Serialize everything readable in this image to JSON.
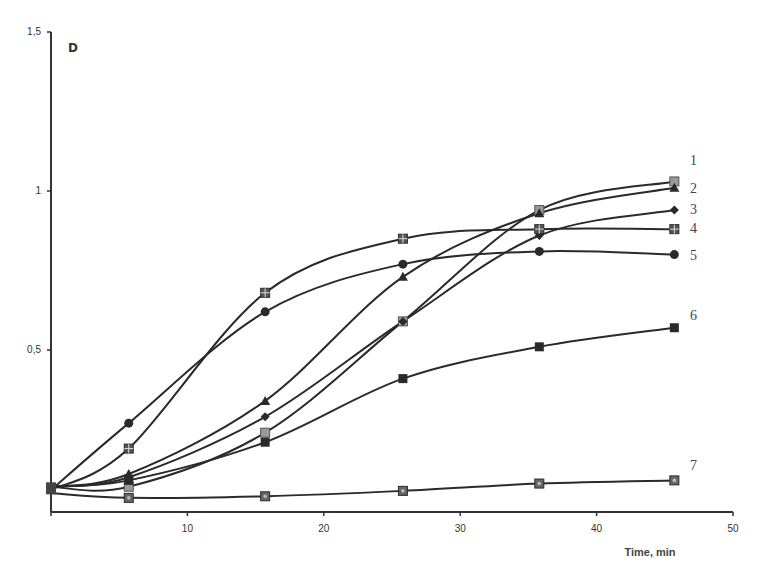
{
  "chart_data": {
    "type": "line",
    "title": "",
    "panel_label": "D",
    "xlabel": "Time, min",
    "ylabel": "",
    "xlim": [
      0,
      50
    ],
    "ylim": [
      0,
      1.5
    ],
    "x_ticks": [
      10,
      20,
      30,
      40,
      50
    ],
    "x_tick_labels": [
      "10",
      "20",
      "30",
      "40",
      "50"
    ],
    "y_ticks": [
      0.5,
      1,
      1.5
    ],
    "y_tick_labels": [
      "0,5",
      "1",
      "1,5"
    ],
    "grid": false,
    "legend_position": "inline-right",
    "x": [
      0,
      5.7,
      15.7,
      25.8,
      35.8,
      45.7
    ],
    "series": [
      {
        "name": "1",
        "marker": "square-grey",
        "values": [
          0.07,
          0.07,
          0.24,
          0.59,
          0.94,
          1.03
        ]
      },
      {
        "name": "2",
        "marker": "triangle",
        "values": [
          0.07,
          0.11,
          0.34,
          0.73,
          0.93,
          1.01
        ]
      },
      {
        "name": "3",
        "marker": "diamond",
        "values": [
          0.07,
          0.1,
          0.29,
          0.59,
          0.86,
          0.94
        ]
      },
      {
        "name": "4",
        "marker": "square-cross",
        "values": [
          0.06,
          0.19,
          0.68,
          0.85,
          0.88,
          0.88
        ]
      },
      {
        "name": "5",
        "marker": "circle",
        "values": [
          0.06,
          0.27,
          0.62,
          0.77,
          0.81,
          0.8
        ]
      },
      {
        "name": "6",
        "marker": "square-filled",
        "values": [
          0.07,
          0.09,
          0.21,
          0.41,
          0.51,
          0.57
        ]
      },
      {
        "name": "7",
        "marker": "square-dot",
        "values": [
          0.05,
          0.035,
          0.04,
          0.057,
          0.08,
          0.09
        ]
      }
    ]
  },
  "colors": {
    "line": "#2a2a2a",
    "axis": "#333333",
    "marker_grey": "#9a9a9a"
  }
}
